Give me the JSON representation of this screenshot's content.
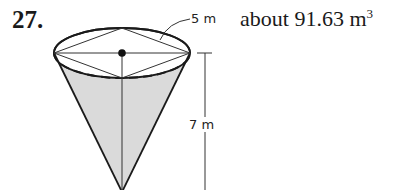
{
  "problem": {
    "number": "27.",
    "answer_prefix": "about 91.63 m",
    "answer_exponent": "3"
  },
  "figure": {
    "shape": "cone",
    "radius_label": "5 m",
    "height_label": "7 m",
    "fill_color": "#d8d8d8",
    "stroke_color": "#1a1a1a"
  }
}
